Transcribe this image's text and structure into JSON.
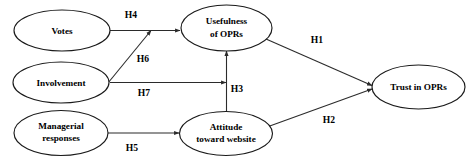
{
  "diagram": {
    "type": "path-model-diagram",
    "colors": {
      "background": "#ffffff",
      "node_stroke": "#1a1a1a",
      "node_fill": "#ffffff",
      "line": "#2b2b2b",
      "text": "#000000"
    },
    "nodes": [
      {
        "id": "votes",
        "label_line1": "Votes",
        "label_line2": ""
      },
      {
        "id": "involvement",
        "label_line1": "Involvement",
        "label_line2": ""
      },
      {
        "id": "managerial-responses",
        "label_line1": "Managerial",
        "label_line2": "responses"
      },
      {
        "id": "usefulness-of-oprs",
        "label_line1": "Usefulness",
        "label_line2": "of OPRs"
      },
      {
        "id": "attitude-toward-website",
        "label_line1": "Attitude",
        "label_line2": "toward website"
      },
      {
        "id": "trust-in-oprs",
        "label_line1": "Trust in OPRs",
        "label_line2": ""
      }
    ],
    "paths": [
      {
        "id": "h1",
        "label": "H1",
        "from": "usefulness-of-oprs",
        "to": "trust-in-oprs"
      },
      {
        "id": "h2",
        "label": "H2",
        "from": "attitude-toward-website",
        "to": "trust-in-oprs"
      },
      {
        "id": "h3",
        "label": "H3",
        "from": "attitude-toward-website",
        "to": "usefulness-of-oprs"
      },
      {
        "id": "h4",
        "label": "H4",
        "from": "votes",
        "to": "usefulness-of-oprs"
      },
      {
        "id": "h5",
        "label": "H5",
        "from": "managerial-responses",
        "to": "attitude-toward-website"
      },
      {
        "id": "h6",
        "label": "H6",
        "from": "involvement",
        "to": "usefulness-of-oprs"
      },
      {
        "id": "h7",
        "label": "H7",
        "from": "involvement",
        "to": "usefulness-of-oprs"
      }
    ]
  }
}
